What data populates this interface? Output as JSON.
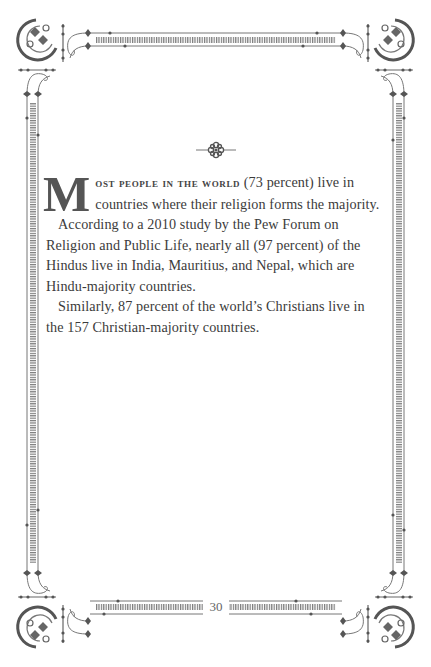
{
  "page": {
    "ornament": "floral-ornament",
    "drop_cap": "M",
    "first_line_smallcaps": "ost people in the world",
    "paragraphs": [
      {
        "lead": " (73 percent) live in countries where their religion forms the majority."
      },
      {
        "text": "According to a 2010 study by the Pew Forum on Religion and Public Life, nearly all (97 percent) of the Hindus live in India, Mauritius, and Nepal, which are Hindu-majority countries."
      },
      {
        "text": "Similarly, 87 percent of the world’s Christians live in the 157 Christian-majority countries."
      }
    ],
    "page_number": "30"
  },
  "colors": {
    "ink": "#3b3b3b",
    "frame": "#6a6a6a",
    "background": "#ffffff"
  }
}
